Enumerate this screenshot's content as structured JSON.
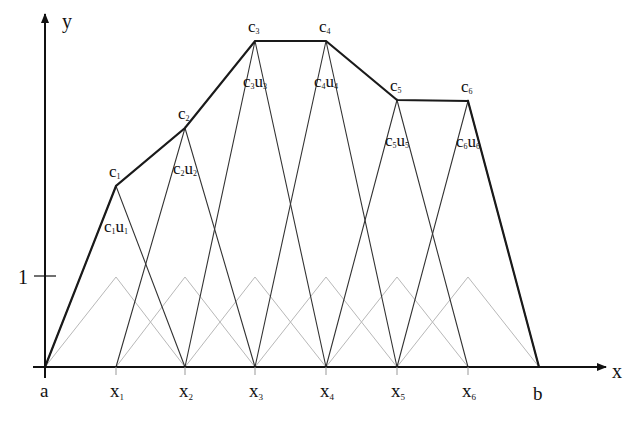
{
  "axes": {
    "x_label": "x",
    "y_label": "y",
    "unit_tick_label": "1",
    "origin_label": "a",
    "end_label": "b"
  },
  "nodes": [
    {
      "label": "x",
      "sub": "1",
      "px": 116,
      "coef": "c",
      "coef_sub": "1",
      "peak_y": 186,
      "prod": "u",
      "prod_sub": "1"
    },
    {
      "label": "x",
      "sub": "2",
      "px": 185,
      "coef": "c",
      "coef_sub": "2",
      "peak_y": 128,
      "prod": "u",
      "prod_sub": "2"
    },
    {
      "label": "x",
      "sub": "3",
      "px": 255,
      "coef": "c",
      "coef_sub": "3",
      "peak_y": 41,
      "prod": "u",
      "prod_sub": "3"
    },
    {
      "label": "x",
      "sub": "4",
      "px": 326,
      "coef": "c",
      "coef_sub": "4",
      "peak_y": 41,
      "prod": "u",
      "prod_sub": "4"
    },
    {
      "label": "x",
      "sub": "5",
      "px": 397,
      "coef": "c",
      "coef_sub": "5",
      "peak_y": 100,
      "prod": "u",
      "prod_sub": "5"
    },
    {
      "label": "x",
      "sub": "6",
      "px": 468,
      "coef": "c",
      "coef_sub": "6",
      "peak_y": 101,
      "prod": "u",
      "prod_sub": "6"
    }
  ],
  "geometry": {
    "a_px": 45,
    "b_px": 539,
    "axis_y": 367,
    "unit_y": 277
  },
  "colors": {
    "envelope": "#1a1a1a",
    "scaled_basis": "#333333",
    "unit_basis": "#b8b8b8",
    "axis": "#111111"
  }
}
